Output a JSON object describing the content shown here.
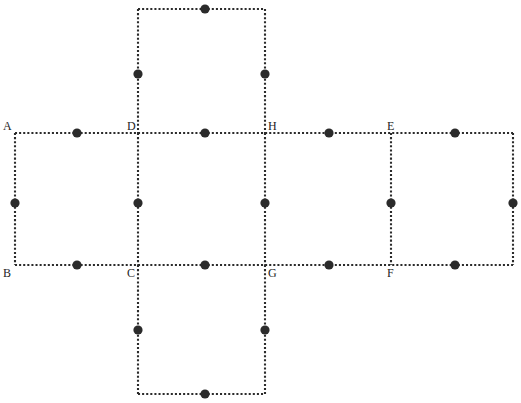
{
  "figure": {
    "canvas": {
      "width": 521,
      "height": 403
    },
    "colors": {
      "background": "#ffffff",
      "edge": "#2b2b2b",
      "dot": "#2b2b2b",
      "label": "#1d1d1d"
    },
    "style": {
      "edge_style": "dotted",
      "edge_width": 2.1,
      "dot_radius": 4.6
    },
    "grid": {
      "columns_x": [
        15,
        138,
        265,
        391,
        513
      ],
      "rows_y": [
        9,
        133,
        265,
        394
      ]
    },
    "squares": [
      {
        "name": "top-square",
        "x1": 138,
        "y1": 9,
        "x2": 265,
        "y2": 133
      },
      {
        "name": "left-square",
        "x1": 15,
        "y1": 133,
        "x2": 138,
        "y2": 265
      },
      {
        "name": "center-left-square",
        "x1": 138,
        "y1": 133,
        "x2": 265,
        "y2": 265
      },
      {
        "name": "center-right-square",
        "x1": 265,
        "y1": 133,
        "x2": 391,
        "y2": 265
      },
      {
        "name": "right-square",
        "x1": 391,
        "y1": 133,
        "x2": 513,
        "y2": 265
      },
      {
        "name": "bottom-square",
        "x1": 138,
        "y1": 265,
        "x2": 265,
        "y2": 394
      }
    ],
    "edges": [
      {
        "name": "top-square-top-edge",
        "x1": 138,
        "y1": 9,
        "x2": 265,
        "y2": 9
      },
      {
        "name": "top-square-left-edge",
        "x1": 138,
        "y1": 9,
        "x2": 138,
        "y2": 133
      },
      {
        "name": "top-square-right-edge",
        "x1": 265,
        "y1": 9,
        "x2": 265,
        "y2": 133
      },
      {
        "name": "middle-row-top-edge",
        "x1": 15,
        "y1": 133,
        "x2": 513,
        "y2": 133
      },
      {
        "name": "middle-row-bottom-edge",
        "x1": 15,
        "y1": 265,
        "x2": 513,
        "y2": 265
      },
      {
        "name": "left-square-left-edge",
        "x1": 15,
        "y1": 133,
        "x2": 15,
        "y2": 265
      },
      {
        "name": "vertical-divider-d-c",
        "x1": 138,
        "y1": 133,
        "x2": 138,
        "y2": 265
      },
      {
        "name": "vertical-divider-h-g",
        "x1": 265,
        "y1": 133,
        "x2": 265,
        "y2": 265
      },
      {
        "name": "vertical-divider-e-f",
        "x1": 391,
        "y1": 133,
        "x2": 391,
        "y2": 265
      },
      {
        "name": "right-square-right-edge",
        "x1": 513,
        "y1": 133,
        "x2": 513,
        "y2": 265
      },
      {
        "name": "bottom-square-left-edge",
        "x1": 138,
        "y1": 265,
        "x2": 138,
        "y2": 394
      },
      {
        "name": "bottom-square-right-edge",
        "x1": 265,
        "y1": 265,
        "x2": 265,
        "y2": 394
      },
      {
        "name": "bottom-square-bottom-edge",
        "x1": 138,
        "y1": 394,
        "x2": 265,
        "y2": 394
      }
    ],
    "midpoint_dots": [
      {
        "name": "dot-top-square-top",
        "cx": 205,
        "cy": 9
      },
      {
        "name": "dot-top-square-left",
        "cx": 138,
        "cy": 74
      },
      {
        "name": "dot-top-square-right",
        "cx": 265,
        "cy": 74
      },
      {
        "name": "dot-a-d-top",
        "cx": 77,
        "cy": 133
      },
      {
        "name": "dot-d-h-top",
        "cx": 205,
        "cy": 133
      },
      {
        "name": "dot-h-e-top",
        "cx": 329,
        "cy": 133
      },
      {
        "name": "dot-e-right-top",
        "cx": 455,
        "cy": 133
      },
      {
        "name": "dot-left-square-left",
        "cx": 15,
        "cy": 203
      },
      {
        "name": "dot-divider-d-c",
        "cx": 138,
        "cy": 203
      },
      {
        "name": "dot-divider-h-g",
        "cx": 265,
        "cy": 203
      },
      {
        "name": "dot-divider-e-f",
        "cx": 391,
        "cy": 203
      },
      {
        "name": "dot-right-square-right",
        "cx": 513,
        "cy": 203
      },
      {
        "name": "dot-b-c-bottom",
        "cx": 77,
        "cy": 265
      },
      {
        "name": "dot-c-g-bottom",
        "cx": 205,
        "cy": 265
      },
      {
        "name": "dot-g-f-bottom",
        "cx": 329,
        "cy": 265
      },
      {
        "name": "dot-f-right-bottom",
        "cx": 455,
        "cy": 265
      },
      {
        "name": "dot-bottom-square-left",
        "cx": 138,
        "cy": 330
      },
      {
        "name": "dot-bottom-square-right",
        "cx": 265,
        "cy": 330
      },
      {
        "name": "dot-bottom-square-bottom",
        "cx": 205,
        "cy": 394
      }
    ],
    "vertex_labels": [
      {
        "name": "vertex-label-a",
        "text": "A",
        "x": 3,
        "y": 120
      },
      {
        "name": "vertex-label-d",
        "text": "D",
        "x": 127,
        "y": 120
      },
      {
        "name": "vertex-label-h",
        "text": "H",
        "x": 268,
        "y": 120
      },
      {
        "name": "vertex-label-e",
        "text": "E",
        "x": 387,
        "y": 120
      },
      {
        "name": "vertex-label-b",
        "text": "B",
        "x": 3,
        "y": 267
      },
      {
        "name": "vertex-label-c",
        "text": "C",
        "x": 127,
        "y": 267
      },
      {
        "name": "vertex-label-g",
        "text": "G",
        "x": 268,
        "y": 267
      },
      {
        "name": "vertex-label-f",
        "text": "F",
        "x": 387,
        "y": 267
      }
    ]
  }
}
